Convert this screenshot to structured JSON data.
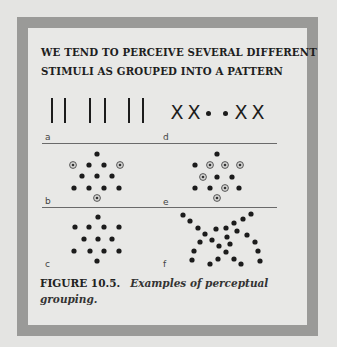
{
  "title_lines": [
    "WE TEND TO PERCEIVE SEVERAL DIFFERENT",
    "STIMULI AS GROUPED INTO A PATTERN"
  ],
  "panels": {
    "a": {
      "label": "a",
      "description": "three pairs of vertical lines (grouping by proximity)",
      "bars_x": [
        52,
        65,
        90,
        105,
        129,
        143
      ],
      "bar_top": 98,
      "bar_bottom": 123
    },
    "d": {
      "label": "d",
      "description": "X X . . X X (grouping by similarity)",
      "glyphs": [
        {
          "char": "X",
          "x": 177
        },
        {
          "char": "X",
          "x": 194
        },
        {
          "char": "dot",
          "x": 208
        },
        {
          "char": "dot",
          "x": 225
        },
        {
          "char": "X",
          "x": 241
        },
        {
          "char": "X",
          "x": 258
        }
      ],
      "y": 103
    },
    "b": {
      "label": "b",
      "description": "star of dots with circled points at tips",
      "filled": [
        [
          97,
          154
        ],
        [
          89,
          165
        ],
        [
          104,
          165
        ],
        [
          82,
          176
        ],
        [
          97,
          176
        ],
        [
          112,
          176
        ],
        [
          74,
          188
        ],
        [
          89,
          188
        ],
        [
          104,
          188
        ],
        [
          119,
          188
        ]
      ],
      "circled": [
        [
          73,
          165
        ],
        [
          120,
          165
        ],
        [
          97,
          198
        ]
      ]
    },
    "e": {
      "label": "e",
      "description": "star of dots with circled points scattered",
      "filled": [
        [
          217,
          154
        ],
        [
          195,
          165
        ],
        [
          217,
          177
        ],
        [
          232,
          177
        ],
        [
          195,
          188
        ],
        [
          210,
          188
        ],
        [
          239,
          188
        ]
      ],
      "circled": [
        [
          210,
          165
        ],
        [
          225,
          165
        ],
        [
          240,
          165
        ],
        [
          203,
          177
        ],
        [
          225,
          188
        ],
        [
          217,
          198
        ]
      ]
    },
    "c": {
      "label": "c",
      "description": "plain star of dots (closure)",
      "filled": [
        [
          98,
          217
        ],
        [
          75,
          227
        ],
        [
          89,
          227
        ],
        [
          104,
          227
        ],
        [
          119,
          227
        ],
        [
          84,
          239
        ],
        [
          98,
          239
        ],
        [
          112,
          239
        ],
        [
          74,
          251
        ],
        [
          90,
          251
        ],
        [
          104,
          251
        ],
        [
          119,
          251
        ],
        [
          97,
          261
        ]
      ]
    },
    "f": {
      "label": "f",
      "description": "two crossing curved lines of dots (continuity)",
      "filled": [
        [
          183,
          215
        ],
        [
          190,
          221
        ],
        [
          198,
          228
        ],
        [
          205,
          234
        ],
        [
          216,
          229
        ],
        [
          226,
          228
        ],
        [
          234,
          223
        ],
        [
          243,
          219
        ],
        [
          251,
          214
        ],
        [
          227,
          237
        ],
        [
          237,
          231
        ],
        [
          247,
          235
        ],
        [
          200,
          242
        ],
        [
          212,
          240
        ],
        [
          219,
          246
        ],
        [
          230,
          244
        ],
        [
          255,
          242
        ],
        [
          194,
          251
        ],
        [
          226,
          252
        ],
        [
          258,
          251
        ],
        [
          192,
          260
        ],
        [
          218,
          259
        ],
        [
          234,
          259
        ],
        [
          210,
          264
        ],
        [
          241,
          264
        ],
        [
          260,
          261
        ]
      ]
    }
  },
  "labels": {
    "a": {
      "text": "a",
      "x": 45,
      "y": 133
    },
    "d": {
      "text": "d",
      "x": 163,
      "y": 133
    },
    "b": {
      "text": "b",
      "x": 45,
      "y": 197
    },
    "e": {
      "text": "e",
      "x": 163,
      "y": 198
    },
    "c": {
      "text": "c",
      "x": 45,
      "y": 260
    },
    "f": {
      "text": "f",
      "x": 163,
      "y": 260
    }
  },
  "dividers": [
    {
      "x1": 42,
      "x2": 277,
      "y": 143
    },
    {
      "x1": 42,
      "x2": 277,
      "y": 207
    }
  ],
  "caption": {
    "figure_number": "FIGURE 10.5.",
    "text_line1": "Examples of perceptual",
    "text_line2": "grouping."
  },
  "colors": {
    "background": "#e4e4e2",
    "frame_border": "#9a9a98",
    "frame_fill": "#e8e8e6",
    "ink": "#1c1c1c"
  }
}
